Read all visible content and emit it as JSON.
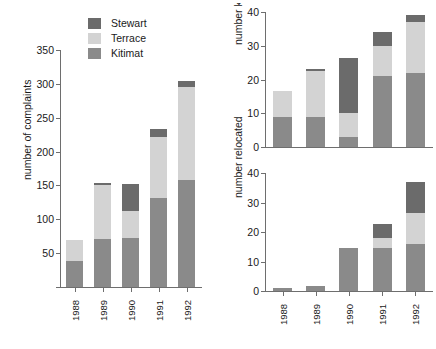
{
  "legend": {
    "position": "top-center-left",
    "entries": [
      {
        "label": "Stewart",
        "color": "#6b6b6b"
      },
      {
        "label": "Terrace",
        "color": "#d3d3d3"
      },
      {
        "label": "Kitimat",
        "color": "#8a8a8a"
      }
    ]
  },
  "chart_data": [
    {
      "type": "bar",
      "id": "complaints",
      "stacked": true,
      "title": "",
      "xlabel": "",
      "ylabel": "number of complaints",
      "categories": [
        "1988",
        "1989",
        "1990",
        "1991",
        "1992"
      ],
      "yticks": [
        0,
        50,
        100,
        150,
        200,
        250,
        300,
        350
      ],
      "ytick_labels": [
        "",
        "50",
        "100",
        "150",
        "200",
        "250",
        "300",
        "350"
      ],
      "ylim": [
        0,
        350
      ],
      "grid": false,
      "series": [
        {
          "name": "Kitimat",
          "color": "#8a8a8a",
          "values": [
            38,
            71,
            72,
            132,
            158
          ]
        },
        {
          "name": "Terrace",
          "color": "#d3d3d3",
          "values": [
            32,
            80,
            40,
            89,
            137
          ]
        },
        {
          "name": "Stewart",
          "color": "#6b6b6b",
          "values": [
            0,
            2,
            40,
            12,
            9
          ]
        }
      ],
      "totals": [
        70,
        153,
        152,
        233,
        304
      ]
    },
    {
      "type": "bar",
      "id": "killed",
      "stacked": true,
      "title": "",
      "xlabel": "",
      "ylabel": "number killed",
      "categories": [
        "1988",
        "1989",
        "1990",
        "1991",
        "1992"
      ],
      "yticks": [
        0,
        10,
        20,
        30,
        40
      ],
      "ytick_labels": [
        "0",
        "10",
        "20",
        "30",
        "40"
      ],
      "ylim": [
        0,
        40
      ],
      "grid": false,
      "series": [
        {
          "name": "Kitimat",
          "color": "#8a8a8a",
          "values": [
            9,
            9,
            3,
            21,
            22
          ]
        },
        {
          "name": "Terrace",
          "color": "#d3d3d3",
          "values": [
            7.5,
            13.5,
            7,
            9,
            15
          ]
        },
        {
          "name": "Stewart",
          "color": "#6b6b6b",
          "values": [
            0,
            0.5,
            16.5,
            4,
            2
          ]
        }
      ],
      "totals": [
        16.5,
        23,
        26.5,
        34,
        39
      ]
    },
    {
      "type": "bar",
      "id": "relocated",
      "stacked": true,
      "title": "",
      "xlabel": "",
      "ylabel": "number relocated",
      "categories": [
        "1988",
        "1989",
        "1990",
        "1991",
        "1992"
      ],
      "yticks": [
        0,
        10,
        20,
        30,
        40
      ],
      "ytick_labels": [
        "0",
        "10",
        "20",
        "30",
        "40"
      ],
      "ylim": [
        0,
        40
      ],
      "grid": false,
      "series": [
        {
          "name": "Kitimat",
          "color": "#8a8a8a",
          "values": [
            1,
            1.8,
            14.7,
            14.7,
            15.8
          ]
        },
        {
          "name": "Terrace",
          "color": "#d3d3d3",
          "values": [
            0,
            0,
            0,
            3.2,
            10.8
          ]
        },
        {
          "name": "Stewart",
          "color": "#6b6b6b",
          "values": [
            0,
            0,
            0,
            4.8,
            10.2
          ]
        }
      ],
      "totals": [
        1,
        1.8,
        14.7,
        22.7,
        36.8
      ]
    }
  ]
}
